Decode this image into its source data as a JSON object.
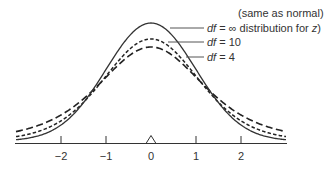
{
  "chart_data": {
    "type": "line",
    "title": "",
    "xlabel": "",
    "ylabel": "",
    "xlim": [
      -3.0,
      3.0
    ],
    "x_ticks": [
      -2,
      -1,
      0,
      1,
      2
    ],
    "x_tick_labels": [
      "−2",
      "−1",
      "0",
      "1",
      "2"
    ],
    "grid": false,
    "legend_position": "upper-right (callout labels)",
    "mean_marker": {
      "x": 0,
      "shape": "triangle"
    },
    "series": [
      {
        "name": "df = ∞ (same as normal distribution for z)",
        "df": "inf",
        "style": "solid",
        "peak_density": 0.399
      },
      {
        "name": "df = 10",
        "df": 10,
        "style": "short-dash",
        "peak_density": 0.389
      },
      {
        "name": "df = 4",
        "df": 4,
        "style": "long-dash",
        "peak_density": 0.375
      }
    ],
    "annotations": [
      {
        "line1": "(same as normal)",
        "prefix": "df",
        "eq": " = ∞ distribution for ",
        "var": "z",
        "suffix": ")"
      },
      {
        "prefix": "df",
        "eq": " = 10"
      },
      {
        "prefix": "df",
        "eq": " = 4"
      }
    ]
  },
  "ticks": [
    "−2",
    "−1",
    "0",
    "1",
    "2"
  ],
  "labels": {
    "normal_line1": "(same as normal)",
    "normal_df": "df",
    "normal_eq": " = ∞ distribution for ",
    "normal_var": "z",
    "normal_suffix": ")",
    "df10_df": "df",
    "df10_eq": " = 10",
    "df4_df": "df",
    "df4_eq": " = 4"
  }
}
